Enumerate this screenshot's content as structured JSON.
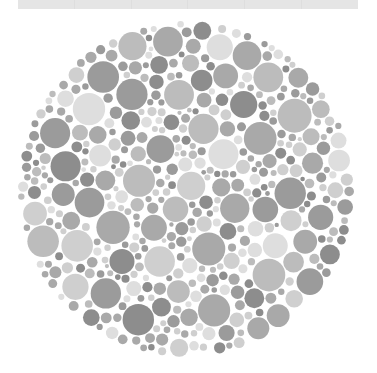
{
  "page": {
    "background_color": "#ffffff",
    "width": 377,
    "height": 373
  },
  "toolbar_strip": {
    "name": "cropped-toolbar-strip",
    "color": "#e5e5e5",
    "divider_color": "#dedede",
    "segments": 6,
    "x": 18,
    "y": 0,
    "width": 340,
    "height": 9
  },
  "plate": {
    "label": "Ishihara Plate",
    "caption": "",
    "center_x": 186,
    "center_y": 189,
    "radius": 168,
    "background_color": "#ffffff",
    "hidden_figure": "",
    "palette": {
      "dark": "#8d8d8d",
      "dark_mid": "#9b9b9b",
      "mid": "#a9a9a9",
      "mid_light": "#bcbcbc",
      "light": "#cfcfcf",
      "very_light": "#dedede"
    },
    "dot_radius_min": 3,
    "dot_radius_max": 17,
    "dot_count": 720,
    "tone_weights": [
      0.17,
      0.16,
      0.19,
      0.17,
      0.18,
      0.13
    ]
  },
  "chart_data": {
    "type": "scatter",
    "xlabel": "",
    "ylabel": "",
    "grid": false,
    "legend": "none",
    "xlim": [
      18,
      354
    ],
    "ylim": [
      21,
      357
    ],
    "categories": [
      "dark",
      "dark_mid",
      "mid",
      "mid_light",
      "light",
      "very_light"
    ],
    "values": [
      122,
      115,
      137,
      122,
      130,
      94
    ]
  }
}
